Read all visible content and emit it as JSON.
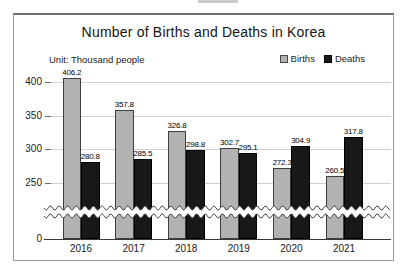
{
  "chart": {
    "unit_label": "Unit: Thousand people"
  },
  "chart_data": {
    "type": "bar",
    "title": "Number of Births and Deaths in Korea",
    "unit": "Thousand people",
    "categories": [
      "2016",
      "2017",
      "2018",
      "2019",
      "2020",
      "2021"
    ],
    "series": [
      {
        "name": "Births",
        "color": "#b2b2b2",
        "values": [
          406.2,
          357.8,
          326.8,
          302.7,
          272.3,
          260.5
        ]
      },
      {
        "name": "Deaths",
        "color": "#181818",
        "values": [
          280.8,
          285.5,
          298.8,
          295.1,
          304.9,
          317.8
        ]
      }
    ],
    "xlabel": "",
    "ylabel": "",
    "y_ticks": [
      0,
      250,
      300,
      350,
      400
    ],
    "ylim": [
      0,
      420
    ],
    "axis_break": [
      0,
      250
    ],
    "grid": true,
    "legend_position": "top-right",
    "value_labels": true
  }
}
